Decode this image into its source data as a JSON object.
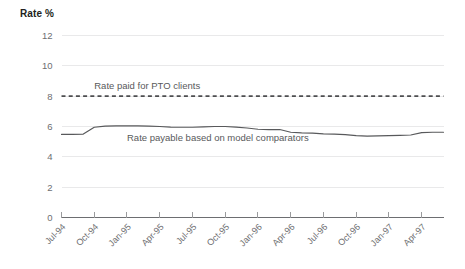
{
  "chart_data": {
    "type": "line",
    "title": "Rate %",
    "xlabel": "",
    "ylabel": "Rate %",
    "ylim": [
      0,
      12
    ],
    "yticks": [
      0,
      2,
      4,
      6,
      8,
      10,
      12
    ],
    "ytick_labels": [
      "0",
      "2",
      "4",
      "6",
      "8",
      "10",
      "12"
    ],
    "grid": true,
    "grid_axis": "y",
    "legend_position": "inline-annotation",
    "x_tick_labels": [
      "Jul-94",
      "Oct-94",
      "Jan-95",
      "Apr-95",
      "Jul-95",
      "Oct-95",
      "Jan-96",
      "Apr-96",
      "Jul-96",
      "Oct-96",
      "Jan-97",
      "Apr-97"
    ],
    "x": [
      "Jul-94",
      "Aug-94",
      "Sep-94",
      "Oct-94",
      "Nov-94",
      "Dec-94",
      "Jan-95",
      "Feb-95",
      "Mar-95",
      "Apr-95",
      "May-95",
      "Jun-95",
      "Jul-95",
      "Aug-95",
      "Sep-95",
      "Oct-95",
      "Nov-95",
      "Dec-95",
      "Jan-96",
      "Feb-96",
      "Mar-96",
      "Apr-96",
      "May-96",
      "Jun-96",
      "Jul-96",
      "Aug-96",
      "Sep-96",
      "Oct-96",
      "Nov-96",
      "Dec-96",
      "Jan-97",
      "Feb-97",
      "Mar-97",
      "Apr-97",
      "May-97",
      "Jun-97"
    ],
    "series": [
      {
        "name": "Rate paid for PTO clients",
        "style": "dashed",
        "label": "Rate paid for PTO clients",
        "label_x": "Oct-94",
        "label_value": 8.45,
        "values": [
          8.0,
          8.0,
          8.0,
          8.0,
          8.0,
          8.0,
          8.0,
          8.0,
          8.0,
          8.0,
          8.0,
          8.0,
          8.0,
          8.0,
          8.0,
          8.0,
          8.0,
          8.0,
          8.0,
          8.0,
          8.0,
          8.0,
          8.0,
          8.0,
          8.0,
          8.0,
          8.0,
          8.0,
          8.0,
          8.0,
          8.0,
          8.0,
          8.0,
          8.0,
          8.0,
          8.0
        ]
      },
      {
        "name": "Rate payable based on model comparators",
        "style": "solid",
        "label": "Rate payable based on model comparators",
        "label_x": "Jan-95",
        "label_value": 5.05,
        "values": [
          5.48,
          5.48,
          5.5,
          5.95,
          6.02,
          6.04,
          6.04,
          6.04,
          6.02,
          6.0,
          5.96,
          5.95,
          5.95,
          5.98,
          6.0,
          6.0,
          5.96,
          5.9,
          5.82,
          5.8,
          5.8,
          5.62,
          5.58,
          5.56,
          5.52,
          5.5,
          5.46,
          5.4,
          5.36,
          5.38,
          5.4,
          5.42,
          5.44,
          5.6,
          5.62,
          5.62
        ]
      }
    ]
  }
}
